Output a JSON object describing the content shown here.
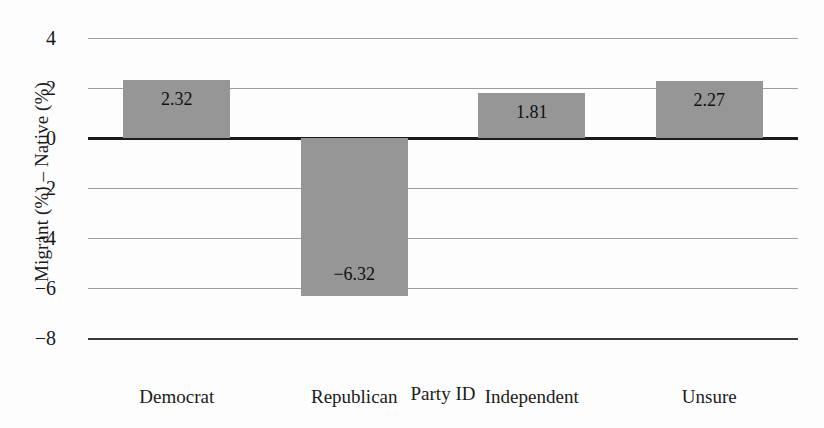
{
  "chart_data": {
    "type": "bar",
    "title": "",
    "xlabel": "Party ID",
    "ylabel": "Migrant (%) – Native (%)",
    "categories": [
      "Democrat",
      "Republican",
      "Independent",
      "Unsure"
    ],
    "values": [
      2.32,
      -6.32,
      1.81,
      2.27
    ],
    "value_labels": [
      "2.32",
      "−6.32",
      "1.81",
      "2.27"
    ],
    "ylim": [
      -8,
      4
    ],
    "yticks": [
      4,
      2,
      0,
      -2,
      -4,
      -6,
      -8
    ],
    "ytick_labels": [
      "4",
      "2",
      "0",
      "−2",
      "−4",
      "−6",
      "−8"
    ],
    "grid": true,
    "legend": "none",
    "bar_color": "#969696",
    "zero_line_color": "#1c1c1c",
    "gridline_color": "#8c8c8c"
  }
}
